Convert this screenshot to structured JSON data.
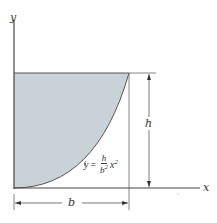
{
  "diagram": {
    "axes": {
      "x_label": "x",
      "y_label": "y"
    },
    "dimensions": {
      "width_label": "b",
      "height_label": "h"
    },
    "equation": {
      "lhs": "y",
      "equals": "=",
      "numerator": "h",
      "denominator": "b",
      "denominator_exp": "2",
      "variable": "x",
      "variable_exp": "2"
    },
    "colors": {
      "shaded_region": "#c9d2d6",
      "lines": "#444444"
    }
  }
}
